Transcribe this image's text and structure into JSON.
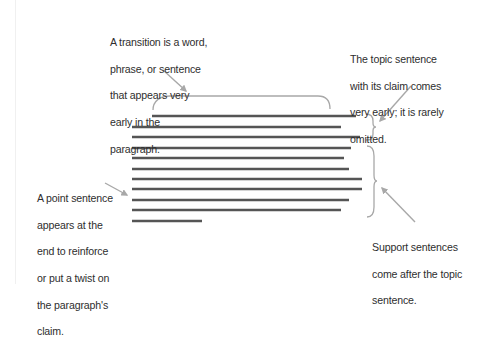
{
  "diagram": {
    "colors": {
      "text": "#2e2e2e",
      "sentence_line": "#555555",
      "annotation": "#a8a8a8",
      "background": "#ffffff"
    },
    "callouts": {
      "transition": {
        "lines": [
          "A transition is a word,",
          "phrase, or sentence",
          "that appears very",
          "early in the",
          "paragraph."
        ]
      },
      "topic": {
        "lines": [
          "The topic sentence",
          "with its claim comes",
          "very early; it is rarely",
          "omitted."
        ]
      },
      "point": {
        "lines": [
          "A point sentence",
          "appears at the",
          "end to reinforce",
          "or put a twist on",
          "the paragraph's",
          "claim."
        ]
      },
      "support": {
        "lines": [
          "Support sentences",
          "come after the topic",
          "sentence."
        ]
      }
    },
    "paragraph_lines": [
      {
        "x1": 152,
        "x2": 356,
        "y": 116,
        "role": "topic-first"
      },
      {
        "x1": 132,
        "x2": 341,
        "y": 127,
        "role": "topic"
      },
      {
        "x1": 132,
        "x2": 360,
        "y": 137,
        "role": "topic"
      },
      {
        "x1": 132,
        "x2": 351,
        "y": 148,
        "role": "support"
      },
      {
        "x1": 132,
        "x2": 344,
        "y": 158,
        "role": "support"
      },
      {
        "x1": 132,
        "x2": 349,
        "y": 169,
        "role": "support"
      },
      {
        "x1": 132,
        "x2": 362,
        "y": 179,
        "role": "support"
      },
      {
        "x1": 132,
        "x2": 362,
        "y": 189,
        "role": "support"
      },
      {
        "x1": 132,
        "x2": 349,
        "y": 200,
        "role": "support"
      },
      {
        "x1": 132,
        "x2": 341,
        "y": 210,
        "role": "support"
      },
      {
        "x1": 132,
        "x2": 202,
        "y": 221,
        "role": "point"
      }
    ]
  }
}
